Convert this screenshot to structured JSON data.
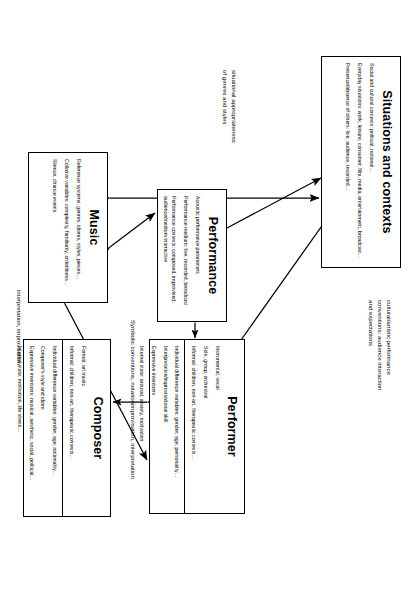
{
  "figure": {
    "orientation": "rotated-90"
  },
  "nodes": {
    "situations": {
      "title": "Situations and contexts",
      "lines": [
        "Social and cultural contexts: political, national…",
        "Everyday situations: work, leisure, consumer, film, media, entertainment, broadcast…",
        "Presence/absence of others: live, audience, recorded…"
      ]
    },
    "music": {
      "title": "Music",
      "lines": [
        "Reference systems, genres, idioms, styles, pieces…",
        "Collative variables: complexity, familiarity, orderliness…",
        "Silence, chance events"
      ]
    },
    "performance": {
      "title": "Performance",
      "lines": [
        "Acoustic performance parameters",
        "Performance medium: live, recorded, broadcast",
        "Performance contexts: composed, improvised, audience/medium interactive"
      ]
    },
    "performer": {
      "title": "Performer",
      "top_lines": [
        "Instrumental, vocal",
        "Solo, group, orchestral",
        "Informal: children, non-art, therapeutic contexts…"
      ],
      "bottom_lines": [
        "Individual difference variables: gender, age, personality…",
        "Interpretative/improvisational skill",
        "Expressive intentions",
        "Internal state: arousal, anxiety, motivation"
      ]
    },
    "composer": {
      "title": "Composer",
      "top_lines": [
        "Formal: art music",
        "Informal: children, non-art, therapeutic contexts…"
      ],
      "bottom_lines": [
        "Individual difference variables: gender, age, nationality…",
        "Composer's style and idiom",
        "Expressive intentions: musical, aesthetic, social, political…",
        "Internal state: motivation, life stress…"
      ]
    }
  },
  "edge_labels": {
    "cultural": "cultural/artistic performance\nconventions: audience interaction\nand expectations",
    "situational": "situational appropriateness\nof  genres and styles",
    "interpretation_improvisation": "interpretation, improvisation",
    "improvisation_interpretation": "improvisation, interpretation",
    "symbolic": "Symbolic conventions, notation"
  },
  "style": {
    "line_color": "#000000",
    "box_fill": "#ffffff",
    "background": "#ffffff"
  }
}
